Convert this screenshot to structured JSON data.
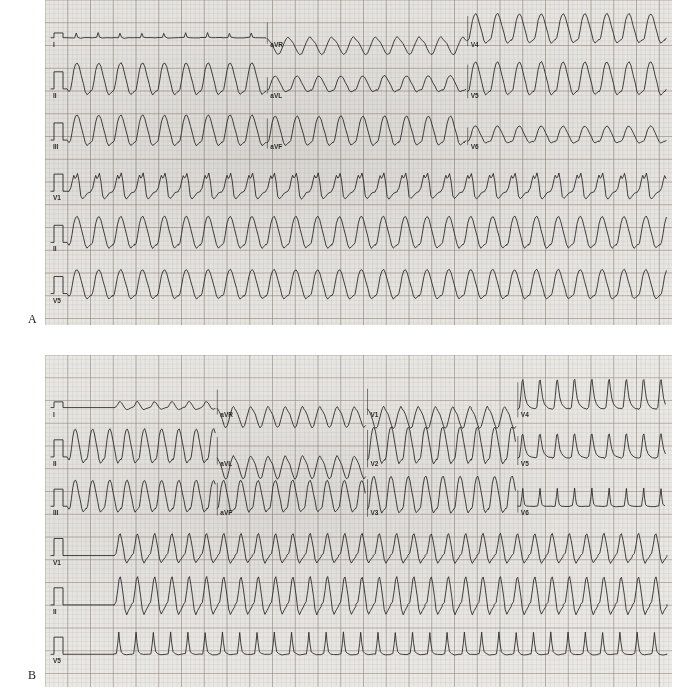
{
  "figure": {
    "type": "12-lead-ecg-figure",
    "panels": [
      {
        "letter": "A",
        "paper_color": "#e9e7e4",
        "grid_minor_color": "#b9b2ab",
        "grid_major_color": "#8d8378",
        "trace_color": "#2a2a2a",
        "rows": [
          {
            "segments": [
              {
                "lead": "I",
                "rate_bpm": 170,
                "amplitude": 5,
                "morphology": "low-amplitude-narrow",
                "polarity": "positive"
              },
              {
                "lead": "aVR",
                "rate_bpm": 170,
                "amplitude": 17,
                "morphology": "wide-negative",
                "polarity": "negative"
              },
              {
                "lead": "V4",
                "rate_bpm": 170,
                "amplitude": 24,
                "morphology": "wide-positive",
                "polarity": "positive"
              }
            ]
          },
          {
            "segments": [
              {
                "lead": "II",
                "rate_bpm": 170,
                "amplitude": 26,
                "morphology": "wide-positive",
                "polarity": "positive"
              },
              {
                "lead": "aVL",
                "rate_bpm": 170,
                "amplitude": 13,
                "morphology": "wide-positive",
                "polarity": "positive"
              },
              {
                "lead": "V5",
                "rate_bpm": 170,
                "amplitude": 27,
                "morphology": "wide-positive",
                "polarity": "positive"
              }
            ]
          },
          {
            "segments": [
              {
                "lead": "III",
                "rate_bpm": 170,
                "amplitude": 25,
                "morphology": "wide-positive",
                "polarity": "positive"
              },
              {
                "lead": "aVF",
                "rate_bpm": 170,
                "amplitude": 24,
                "morphology": "wide-positive",
                "polarity": "positive"
              },
              {
                "lead": "V6",
                "rate_bpm": 170,
                "amplitude": 14,
                "morphology": "wide-positive",
                "polarity": "positive"
              }
            ]
          },
          {
            "segments": [
              {
                "lead": "V1",
                "rate_bpm": 170,
                "amplitude": 18,
                "morphology": "rsR-notched",
                "polarity": "positive",
                "full_width": true
              }
            ]
          },
          {
            "segments": [
              {
                "lead": "II",
                "rate_bpm": 170,
                "amplitude": 26,
                "morphology": "wide-positive",
                "polarity": "positive",
                "full_width": true
              }
            ]
          },
          {
            "segments": [
              {
                "lead": "V5",
                "rate_bpm": 170,
                "amplitude": 24,
                "morphology": "wide-positive",
                "polarity": "positive",
                "full_width": true
              }
            ]
          }
        ]
      },
      {
        "letter": "B",
        "paper_color": "#eceae7",
        "grid_minor_color": "#bdb7b0",
        "grid_major_color": "#948a80",
        "trace_color": "#2a2a2a",
        "rows": [
          {
            "segments": [
              {
                "lead": "I",
                "rate_bpm": 250,
                "amplitude": 6,
                "morphology": "flat-then-flutter",
                "polarity": "positive"
              },
              {
                "lead": "aVR",
                "rate_bpm": 250,
                "amplitude": 20,
                "morphology": "wide-negative",
                "polarity": "negative"
              },
              {
                "lead": "V1",
                "rate_bpm": 250,
                "amplitude": 21,
                "morphology": "wide-negative",
                "polarity": "negative"
              },
              {
                "lead": "V4",
                "rate_bpm": 250,
                "amplitude": 28,
                "morphology": "tall-spiky",
                "polarity": "positive"
              }
            ]
          },
          {
            "segments": [
              {
                "lead": "II",
                "rate_bpm": 250,
                "amplitude": 28,
                "morphology": "wide-positive",
                "polarity": "positive"
              },
              {
                "lead": "aVL",
                "rate_bpm": 250,
                "amplitude": 22,
                "morphology": "wide-negative",
                "polarity": "negative"
              },
              {
                "lead": "V2",
                "rate_bpm": 250,
                "amplitude": 30,
                "morphology": "wide-positive",
                "polarity": "positive"
              },
              {
                "lead": "V5",
                "rate_bpm": 250,
                "amplitude": 23,
                "morphology": "tall-spiky",
                "polarity": "positive"
              }
            ]
          },
          {
            "segments": [
              {
                "lead": "III",
                "rate_bpm": 250,
                "amplitude": 26,
                "morphology": "wide-positive",
                "polarity": "positive"
              },
              {
                "lead": "aVF",
                "rate_bpm": 250,
                "amplitude": 26,
                "morphology": "wide-positive",
                "polarity": "positive"
              },
              {
                "lead": "V3",
                "rate_bpm": 250,
                "amplitude": 30,
                "morphology": "wide-positive",
                "polarity": "positive"
              },
              {
                "lead": "V6",
                "rate_bpm": 250,
                "amplitude": 18,
                "morphology": "narrow-spiky",
                "polarity": "positive"
              }
            ]
          },
          {
            "segments": [
              {
                "lead": "V1",
                "rate_bpm": 250,
                "amplitude": 22,
                "morphology": "flat-then-flutter",
                "polarity": "positive",
                "full_width": true
              }
            ]
          },
          {
            "segments": [
              {
                "lead": "II",
                "rate_bpm": 250,
                "amplitude": 28,
                "morphology": "flat-then-flutter",
                "polarity": "positive",
                "full_width": true
              }
            ]
          },
          {
            "segments": [
              {
                "lead": "V5",
                "rate_bpm": 250,
                "amplitude": 22,
                "morphology": "flat-then-spiky",
                "polarity": "positive",
                "full_width": true
              }
            ]
          }
        ]
      }
    ]
  }
}
